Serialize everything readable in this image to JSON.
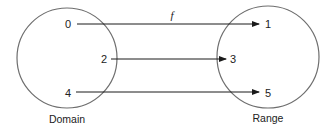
{
  "diagram": {
    "type": "function-mapping",
    "function_label": "f",
    "domain": {
      "label": "Domain",
      "elements": [
        "0",
        "2",
        "4"
      ]
    },
    "range": {
      "label": "Range",
      "elements": [
        "1",
        "3",
        "5"
      ]
    },
    "mappings": [
      {
        "from": "0",
        "to": "1"
      },
      {
        "from": "2",
        "to": "3"
      },
      {
        "from": "4",
        "to": "5"
      }
    ],
    "colors": {
      "circle_stroke": "#6e6e6e",
      "arrow": "#1a1a1a",
      "text": "#222222"
    }
  }
}
